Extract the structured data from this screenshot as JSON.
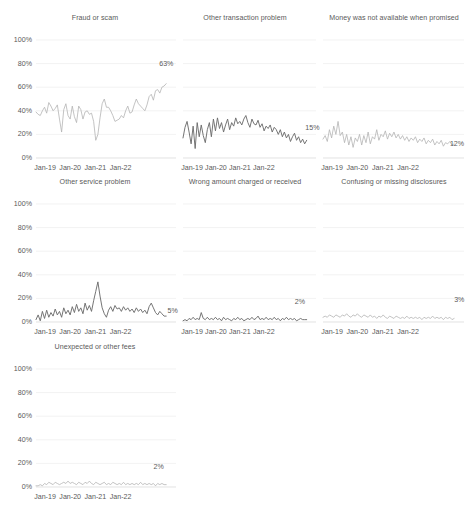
{
  "figure": {
    "layout": "small-multiples-grid",
    "rows": 3,
    "columns": 3,
    "background": "#ffffff",
    "line_color_light": "#b4b4b4",
    "line_color_dark": "#6e6e6e",
    "text_color": "#5a5a5a",
    "gridline_color": "#e9e9e9"
  },
  "chart_data": [
    {
      "type": "line",
      "title": "Fraud or scam",
      "xlabel": "",
      "ylabel": "",
      "ylim": [
        0,
        100
      ],
      "yticks": [
        "0%",
        "20%",
        "40%",
        "60%",
        "80%",
        "100%"
      ],
      "xticks": [
        "Jan-19",
        "Jan-20",
        "Jan-21",
        "Jan-22"
      ],
      "grid": true,
      "legend": "none",
      "end_label": "63%",
      "end_value": 63,
      "line_color": "#b4b4b4",
      "x": [
        "Jan-19",
        "Feb-19",
        "Mar-19",
        "Apr-19",
        "May-19",
        "Jun-19",
        "Jul-19",
        "Aug-19",
        "Sep-19",
        "Oct-19",
        "Nov-19",
        "Dec-19",
        "Jan-20",
        "Feb-20",
        "Mar-20",
        "Apr-20",
        "May-20",
        "Jun-20",
        "Jul-20",
        "Aug-20",
        "Sep-20",
        "Oct-20",
        "Nov-20",
        "Dec-20",
        "Jan-21",
        "Feb-21",
        "Mar-21",
        "Apr-21",
        "May-21",
        "Jun-21",
        "Jul-21",
        "Aug-21",
        "Sep-21",
        "Oct-21",
        "Nov-21",
        "Dec-21",
        "Jan-22",
        "Feb-22",
        "Mar-22",
        "Apr-22",
        "May-22",
        "Jun-22",
        "Jul-22",
        "Aug-22",
        "Sep-22",
        "Oct-22",
        "Nov-22",
        "Dec-22"
      ],
      "values": [
        39,
        37,
        36,
        40,
        43,
        38,
        47,
        44,
        40,
        42,
        45,
        33,
        22,
        41,
        46,
        36,
        33,
        44,
        35,
        30,
        44,
        41,
        33,
        39,
        40,
        37,
        38,
        31,
        15,
        20,
        34,
        46,
        50,
        43,
        43,
        40,
        36,
        31,
        32,
        33,
        36,
        34,
        40,
        44,
        38,
        39,
        45,
        50,
        46,
        44,
        42,
        40,
        45,
        52,
        54,
        49,
        57,
        58,
        55,
        60,
        61,
        63
      ]
    },
    {
      "type": "line",
      "title": "Other transaction problem",
      "xlabel": "",
      "ylabel": "",
      "ylim": [
        0,
        100
      ],
      "yticks": [
        "0%",
        "20%",
        "40%",
        "60%",
        "80%",
        "100%"
      ],
      "xticks": [
        "Jan-19",
        "Jan-20",
        "Jan-21",
        "Jan-22"
      ],
      "grid": true,
      "legend": "none",
      "end_label": "15%",
      "end_value": 15,
      "line_color": "#6e6e6e",
      "values": [
        17,
        26,
        31,
        22,
        12,
        27,
        8,
        30,
        18,
        28,
        19,
        13,
        24,
        30,
        18,
        33,
        23,
        34,
        25,
        30,
        22,
        28,
        33,
        24,
        30,
        27,
        34,
        29,
        31,
        28,
        33,
        36,
        30,
        26,
        33,
        29,
        28,
        32,
        26,
        29,
        23,
        27,
        25,
        28,
        22,
        26,
        24,
        20,
        24,
        18,
        22,
        17,
        20,
        14,
        18,
        21,
        15,
        18,
        13,
        16,
        12,
        15
      ]
    },
    {
      "type": "line",
      "title": "Money was not available when promised",
      "xlabel": "",
      "ylabel": "",
      "ylim": [
        0,
        100
      ],
      "yticks": [
        "0%",
        "20%",
        "40%",
        "60%",
        "80%",
        "100%"
      ],
      "xticks": [
        "Jan-19",
        "Jan-20",
        "Jan-21",
        "Jan-22"
      ],
      "grid": true,
      "legend": "none",
      "end_label": "12%",
      "end_value": 12,
      "line_color": "#b4b4b4",
      "values": [
        16,
        19,
        14,
        24,
        17,
        27,
        20,
        31,
        19,
        22,
        13,
        20,
        11,
        18,
        9,
        17,
        14,
        20,
        11,
        19,
        13,
        22,
        12,
        18,
        16,
        24,
        15,
        20,
        18,
        23,
        16,
        21,
        18,
        22,
        17,
        20,
        16,
        19,
        15,
        18,
        14,
        17,
        15,
        18,
        13,
        16,
        14,
        17,
        12,
        15,
        13,
        16,
        11,
        14,
        12,
        15,
        10,
        13,
        12,
        14,
        11,
        12
      ]
    },
    {
      "type": "line",
      "title": "Other service problem",
      "xlabel": "",
      "ylabel": "",
      "ylim": [
        0,
        100
      ],
      "yticks": [
        "0%",
        "20%",
        "40%",
        "60%",
        "80%",
        "100%"
      ],
      "xticks": [
        "Jan-19",
        "Jan-20",
        "Jan-21",
        "Jan-22"
      ],
      "grid": true,
      "legend": "none",
      "end_label": "5%",
      "end_value": 5,
      "line_color": "#6e6e6e",
      "values": [
        2,
        6,
        1,
        9,
        3,
        10,
        4,
        8,
        5,
        11,
        6,
        9,
        4,
        12,
        7,
        10,
        6,
        13,
        8,
        15,
        9,
        12,
        7,
        16,
        10,
        14,
        9,
        18,
        26,
        34,
        22,
        12,
        7,
        4,
        10,
        13,
        9,
        14,
        11,
        12,
        9,
        13,
        10,
        12,
        9,
        11,
        8,
        12,
        9,
        11,
        8,
        10,
        7,
        13,
        16,
        12,
        8,
        6,
        9,
        7,
        5,
        5
      ]
    },
    {
      "type": "line",
      "title": "Wrong amount charged or received",
      "xlabel": "",
      "ylabel": "",
      "ylim": [
        0,
        100
      ],
      "yticks": [
        "0%",
        "20%",
        "40%",
        "60%",
        "80%",
        "100%"
      ],
      "xticks": [
        "Jan-19",
        "Jan-20",
        "Jan-21",
        "Jan-22"
      ],
      "grid": true,
      "legend": "none",
      "end_label": "2%",
      "end_value": 2,
      "line_color": "#6e6e6e",
      "values": [
        1,
        2,
        1,
        3,
        2,
        4,
        2,
        3,
        2,
        8,
        3,
        2,
        4,
        2,
        3,
        2,
        4,
        2,
        3,
        1,
        4,
        2,
        3,
        2,
        1,
        3,
        2,
        4,
        2,
        3,
        1,
        2,
        3,
        2,
        4,
        2,
        3,
        5,
        2,
        3,
        2,
        4,
        2,
        3,
        2,
        4,
        2,
        3,
        1,
        3,
        2,
        4,
        2,
        3,
        2,
        3,
        1,
        2,
        3,
        2,
        2,
        2
      ]
    },
    {
      "type": "line",
      "title": "Confusing or missing disclosures",
      "xlabel": "",
      "ylabel": "",
      "ylim": [
        0,
        100
      ],
      "yticks": [
        "0%",
        "20%",
        "40%",
        "60%",
        "80%",
        "100%"
      ],
      "xticks": [
        "Jan-19",
        "Jan-20",
        "Jan-21",
        "Jan-22"
      ],
      "grid": true,
      "legend": "none",
      "end_label": "3%",
      "end_value": 3,
      "line_color": "#b4b4b4",
      "values": [
        4,
        5,
        4,
        6,
        5,
        4,
        6,
        5,
        4,
        6,
        5,
        7,
        5,
        4,
        6,
        5,
        7,
        5,
        4,
        6,
        5,
        4,
        6,
        4,
        5,
        3,
        5,
        4,
        6,
        4,
        3,
        5,
        4,
        3,
        5,
        4,
        3,
        4,
        3,
        5,
        3,
        4,
        3,
        4,
        3,
        4,
        2,
        4,
        3,
        4,
        3,
        5,
        3,
        4,
        3,
        4,
        2,
        4,
        3,
        4,
        2,
        3
      ]
    },
    {
      "type": "line",
      "title": "Unexpected or other fees",
      "xlabel": "",
      "ylabel": "",
      "ylim": [
        0,
        100
      ],
      "yticks": [
        "0%",
        "20%",
        "40%",
        "60%",
        "80%",
        "100%"
      ],
      "xticks": [
        "Jan-19",
        "Jan-20",
        "Jan-21",
        "Jan-22"
      ],
      "grid": true,
      "legend": "none",
      "end_label": "2%",
      "end_value": 2,
      "line_color": "#b4b4b4",
      "values": [
        1,
        1,
        2,
        1,
        3,
        2,
        4,
        3,
        2,
        4,
        3,
        2,
        3,
        4,
        3,
        5,
        3,
        4,
        3,
        2,
        4,
        3,
        2,
        4,
        3,
        5,
        3,
        2,
        4,
        3,
        2,
        3,
        4,
        2,
        3,
        2,
        4,
        3,
        2,
        3,
        2,
        4,
        2,
        3,
        2,
        3,
        2,
        3,
        2,
        4,
        2,
        3,
        2,
        3,
        2,
        3,
        1,
        3,
        2,
        3,
        2,
        2
      ]
    }
  ]
}
